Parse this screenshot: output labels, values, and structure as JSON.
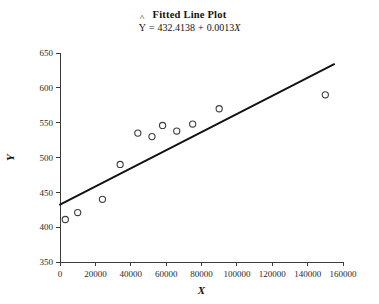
{
  "chart_data": {
    "type": "scatter",
    "title": "Fitted Line Plot",
    "subtitle": "Y = 432.4138 + 0.0013X",
    "subtitle_parts": {
      "response": "Y",
      "equals": "=",
      "intercept": "432.4138",
      "plus": "+",
      "slope": "0.0013",
      "predictor": "X"
    },
    "xlabel": "X",
    "ylabel": "Y",
    "xlim": [
      0,
      160000
    ],
    "ylim": [
      350,
      650
    ],
    "xticks": [
      0,
      20000,
      40000,
      60000,
      80000,
      100000,
      120000,
      140000,
      160000
    ],
    "xtick_labels": [
      "0",
      "20000",
      "40000",
      "60000",
      "80000",
      "100000",
      "120000",
      "140000",
      "160000"
    ],
    "yticks": [
      350,
      400,
      450,
      500,
      550,
      600,
      650
    ],
    "ytick_labels": [
      "350",
      "400",
      "450",
      "500",
      "550",
      "600",
      "650"
    ],
    "grid": false,
    "legend": null,
    "marker": "open-circle",
    "point_color": "#3d3d3d",
    "line_color": "#111111",
    "x": [
      3000,
      10000,
      24000,
      34000,
      44000,
      52000,
      58000,
      66000,
      75000,
      90000,
      150000
    ],
    "y": [
      411,
      421,
      440,
      490,
      535,
      530,
      546,
      538,
      548,
      570,
      590
    ],
    "points": [
      {
        "x": 3000,
        "y": 411
      },
      {
        "x": 10000,
        "y": 421
      },
      {
        "x": 24000,
        "y": 440
      },
      {
        "x": 34000,
        "y": 490
      },
      {
        "x": 44000,
        "y": 535
      },
      {
        "x": 52000,
        "y": 530
      },
      {
        "x": 58000,
        "y": 546
      },
      {
        "x": 66000,
        "y": 538
      },
      {
        "x": 75000,
        "y": 548
      },
      {
        "x": 90000,
        "y": 570
      },
      {
        "x": 150000,
        "y": 590
      }
    ],
    "fit": {
      "intercept": 432.4138,
      "slope": 0.0013,
      "x_start": 0,
      "x_end": 155000
    }
  },
  "footer": {
    "text": ""
  }
}
